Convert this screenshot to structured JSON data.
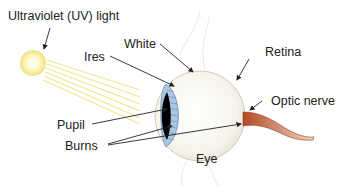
{
  "diagram": {
    "labels": {
      "uv_light": "Ultraviolet (UV) light",
      "white": "White",
      "ires": "Ires",
      "retina": "Retina",
      "pupil": "Pupil",
      "optic_nerve": "Optic nerve",
      "burns": "Burns",
      "eye": "Eye"
    },
    "colors": {
      "sun_core": "#fffbe0",
      "sun_edge": "#f3e98a",
      "rays": "#efe690",
      "iris": "#a9c8e4",
      "iris_lines": "#4f6f91",
      "pupil": "#000000",
      "sclera": "#f7f5ee",
      "nerve": "#c8623a",
      "arrow": "#222222"
    }
  }
}
